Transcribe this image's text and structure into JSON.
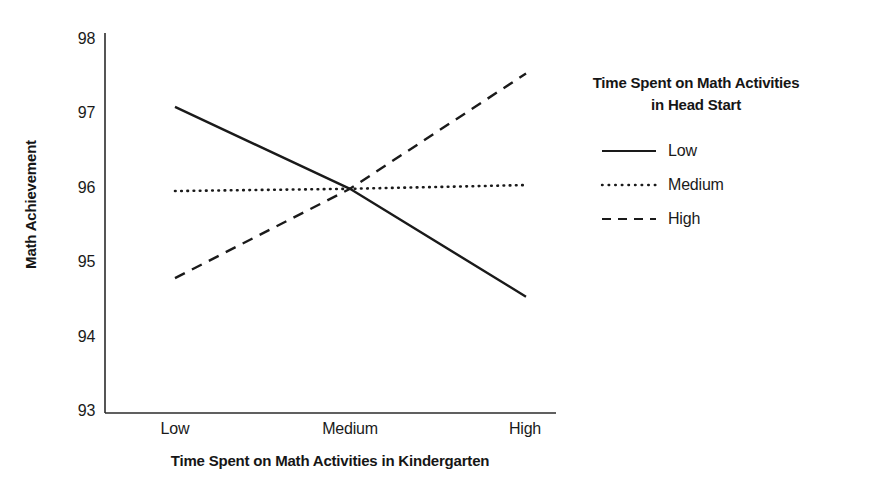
{
  "chart_data": {
    "type": "line",
    "title": "",
    "xlabel": "Time Spent on Math Activities in Kindergarten",
    "ylabel": "Math Achievement",
    "categories": [
      "Low",
      "Medium",
      "High"
    ],
    "xtick_labels": [
      "Low",
      "Medium",
      "High"
    ],
    "ytick_labels": [
      "98",
      "97",
      "96",
      "95",
      "94",
      "93"
    ],
    "ylim": [
      93,
      98
    ],
    "ytick_values": [
      98,
      97,
      96,
      95,
      94,
      93
    ],
    "grid": false,
    "legend_position": "right",
    "legend_title": "Time Spent on Math Activities in Head Start",
    "legend_title_line1": "Time Spent on Math Activities",
    "legend_title_line2": "in Head Start",
    "series": [
      {
        "name": "Low",
        "style": "solid",
        "color": "#1a1a1a",
        "values": [
          97.1,
          96.0,
          94.55
        ]
      },
      {
        "name": "Medium",
        "style": "dotted",
        "color": "#1a1a1a",
        "values": [
          95.97,
          96.0,
          96.05
        ]
      },
      {
        "name": "High",
        "style": "dashed",
        "color": "#1a1a1a",
        "values": [
          94.8,
          96.0,
          97.55
        ]
      }
    ]
  },
  "axes": {
    "y_ticks": [
      {
        "label": "98"
      },
      {
        "label": "97"
      },
      {
        "label": "96"
      },
      {
        "label": "95"
      },
      {
        "label": "94"
      },
      {
        "label": "93"
      }
    ],
    "x_ticks": [
      {
        "label": "Low"
      },
      {
        "label": "Medium"
      },
      {
        "label": "High"
      }
    ],
    "y_axis_title": "Math Achievement",
    "x_axis_title": "Time Spent on Math Activities in Kindergarten"
  },
  "legend": {
    "title_line1": "Time Spent on Math Activities",
    "title_line2": "in Head Start",
    "entries": [
      {
        "label": "Low"
      },
      {
        "label": "Medium"
      },
      {
        "label": "High"
      }
    ]
  }
}
